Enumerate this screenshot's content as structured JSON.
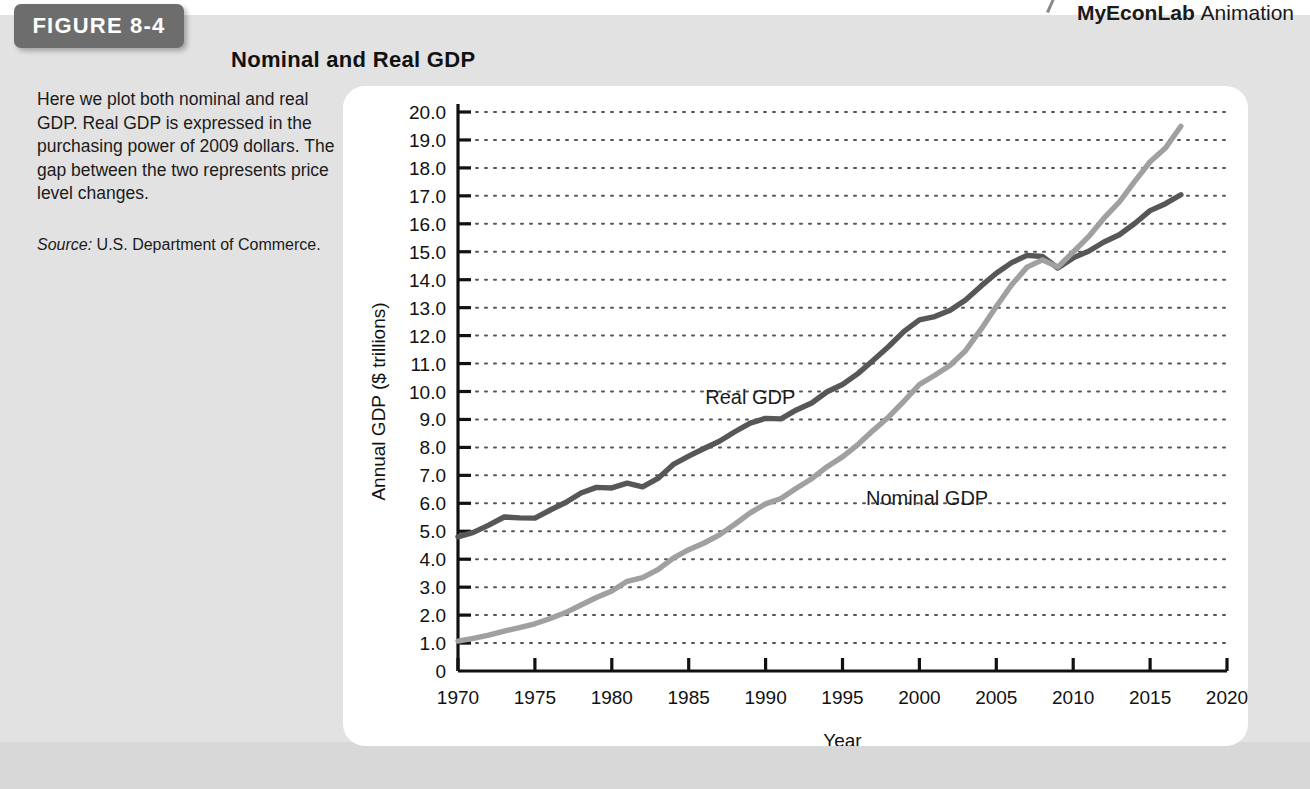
{
  "header": {
    "econlab_brand": "MyEconLab",
    "econlab_word": "Animation",
    "mark_icon": "pointer-mark-icon"
  },
  "figure": {
    "tag_label": "FIGURE 8-4",
    "title": "Nominal and Real GDP",
    "caption": "Here we plot both nominal and real GDP. Real GDP is expressed in the purchasing power of 2009 dollars. The gap between the two represents price level changes.",
    "source_label": "Source:",
    "source_text": "U.S. Department of Commerce."
  },
  "colors": {
    "real_gdp": "#575757",
    "nominal_gdp": "#a0a0a0",
    "axis": "#111111",
    "grid": "#555555",
    "card": "#ffffff",
    "page_gray": "#e2e2e2",
    "tag_gray": "#6d6d6d"
  },
  "chart_data": {
    "type": "line",
    "title": "Nominal and Real GDP",
    "xlabel": "Year",
    "ylabel": "Annual GDP ($ trillions)",
    "xlim": [
      1970,
      2020
    ],
    "ylim": [
      0,
      20
    ],
    "xticks": [
      1970,
      1975,
      1980,
      1985,
      1990,
      1995,
      2000,
      2005,
      2010,
      2015,
      2020
    ],
    "yticks": [
      "0",
      "1.0",
      "2.0",
      "3.0",
      "4.0",
      "5.0",
      "6.0",
      "7.0",
      "8.0",
      "9.0",
      "10.0",
      "11.0",
      "12.0",
      "13.0",
      "14.0",
      "15.0",
      "16.0",
      "17.0",
      "18.0",
      "19.0",
      "20.0"
    ],
    "grid": "horizontal-dotted",
    "legend": "inline-labels",
    "x": [
      1970,
      1971,
      1972,
      1973,
      1974,
      1975,
      1976,
      1977,
      1978,
      1979,
      1980,
      1981,
      1982,
      1983,
      1984,
      1985,
      1986,
      1987,
      1988,
      1989,
      1990,
      1991,
      1992,
      1993,
      1994,
      1995,
      1996,
      1997,
      1998,
      1999,
      2000,
      2001,
      2002,
      2003,
      2004,
      2005,
      2006,
      2007,
      2008,
      2009,
      2010,
      2011,
      2012,
      2013,
      2014,
      2015,
      2016,
      2017
    ],
    "series": [
      {
        "name": "Real GDP",
        "color": "#575757",
        "label_x": 1989.0,
        "label_y": 9.55,
        "values": [
          4.8,
          4.96,
          5.22,
          5.51,
          5.48,
          5.47,
          5.76,
          6.03,
          6.37,
          6.57,
          6.55,
          6.72,
          6.59,
          6.89,
          7.39,
          7.69,
          7.96,
          8.22,
          8.56,
          8.87,
          9.04,
          9.02,
          9.34,
          9.59,
          9.99,
          10.25,
          10.64,
          11.12,
          11.61,
          12.15,
          12.56,
          12.68,
          12.91,
          13.27,
          13.77,
          14.23,
          14.61,
          14.87,
          14.83,
          14.42,
          14.78,
          15.02,
          15.35,
          15.61,
          16.01,
          16.47,
          16.72,
          17.04
        ]
      },
      {
        "name": "Nominal GDP",
        "color": "#a0a0a0",
        "label_x": 2000.5,
        "label_y": 5.95,
        "values": [
          1.07,
          1.17,
          1.28,
          1.43,
          1.55,
          1.69,
          1.88,
          2.09,
          2.36,
          2.63,
          2.86,
          3.21,
          3.34,
          3.63,
          4.04,
          4.34,
          4.58,
          4.87,
          5.25,
          5.66,
          5.98,
          6.17,
          6.54,
          6.88,
          7.31,
          7.66,
          8.1,
          8.61,
          9.09,
          9.66,
          10.25,
          10.58,
          10.94,
          11.46,
          12.22,
          13.04,
          13.82,
          14.45,
          14.71,
          14.45,
          14.99,
          15.54,
          16.2,
          16.78,
          17.52,
          18.22,
          18.71,
          19.49
        ]
      }
    ]
  }
}
